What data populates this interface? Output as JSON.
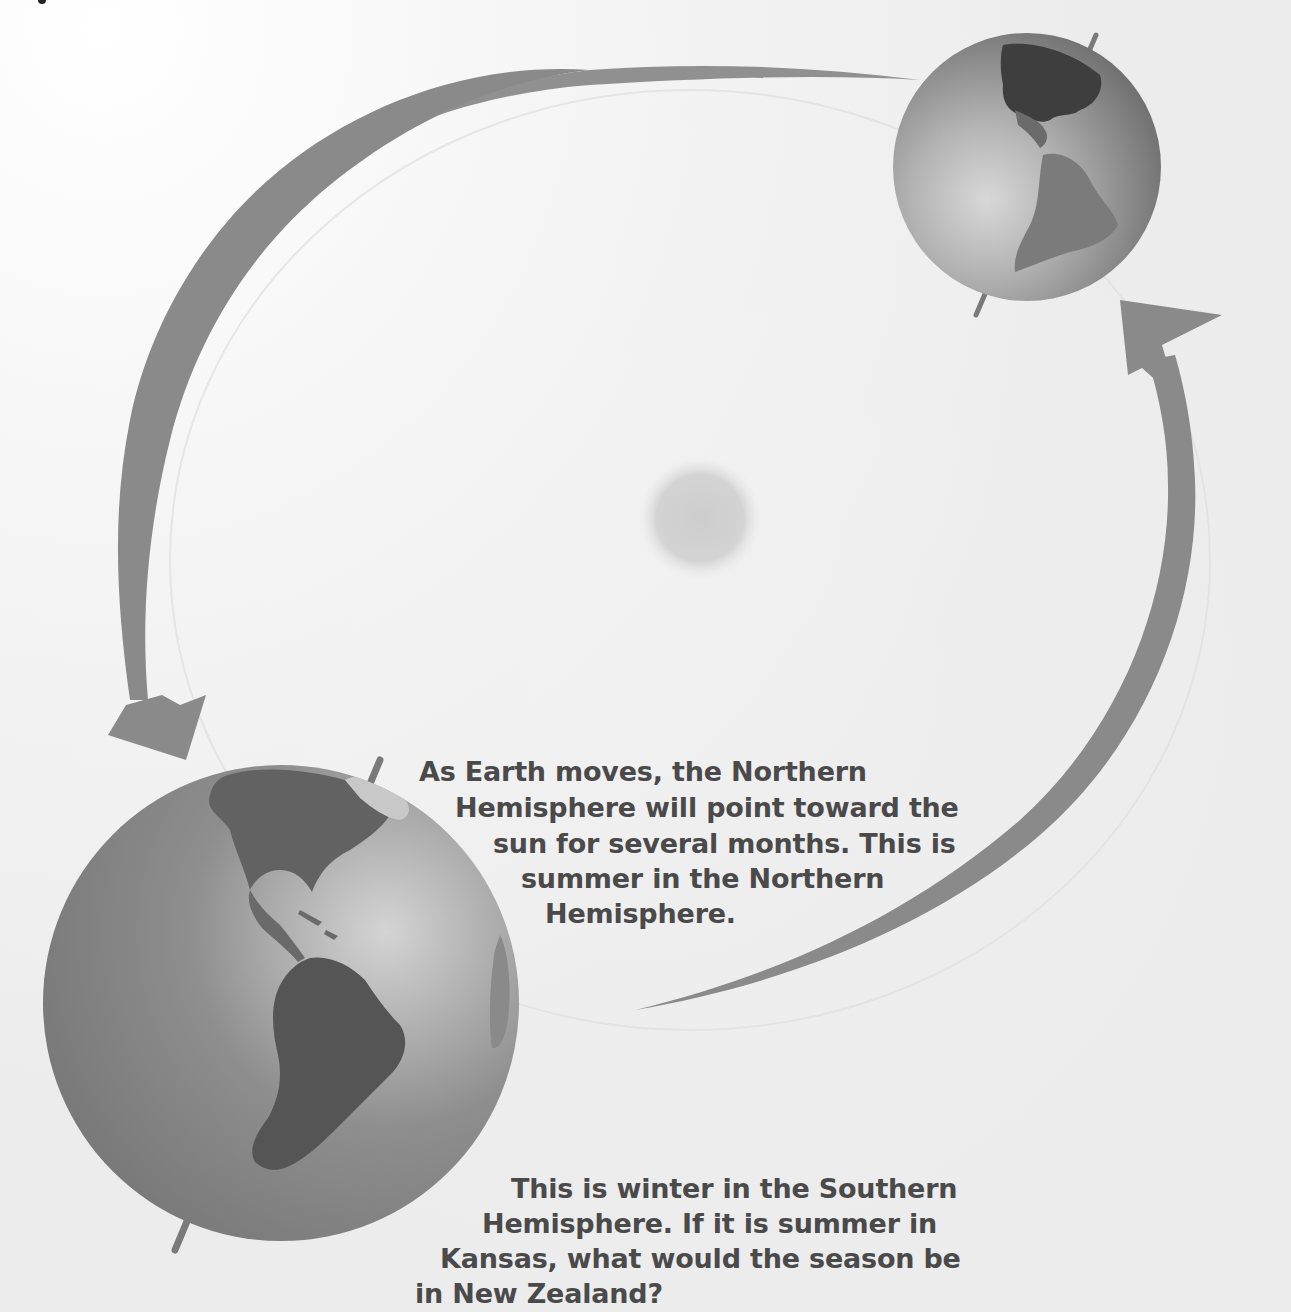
{
  "diagram": {
    "type": "earth-orbit-seasons",
    "sun": {
      "label": "",
      "color": "#c9c9c9"
    },
    "orbit_direction": "counterclockwise",
    "earth_positions": [
      {
        "id": "near",
        "position": "lower-left",
        "size": "large",
        "tilt": "northern-hemisphere-toward-sun"
      },
      {
        "id": "far",
        "position": "upper-right",
        "size": "small",
        "tilt": "axis-tilted"
      }
    ],
    "arrows": [
      {
        "id": "arrow-top-left",
        "from": "upper-right-earth",
        "to": "lower-left-earth"
      },
      {
        "id": "arrow-right",
        "from": "lower-left-earth",
        "to": "upper-right-earth"
      }
    ],
    "colors": {
      "arrow": "#8a8a8a",
      "text": "#4a4a4a",
      "ocean": "#8f8f8f",
      "land": "#5c5c5c",
      "background": "#efefef"
    }
  },
  "captions": {
    "northern_summer": {
      "lines": [
        "As Earth moves, the Northern",
        "Hemisphere will point toward the",
        "sun for several months. This is",
        "summer in the Northern",
        "Hemisphere."
      ]
    },
    "southern_winter": {
      "lines": [
        "This is winter in the Southern",
        "Hemisphere. If it is summer in",
        "Kansas, what would the season be",
        "in New Zealand?"
      ]
    }
  }
}
